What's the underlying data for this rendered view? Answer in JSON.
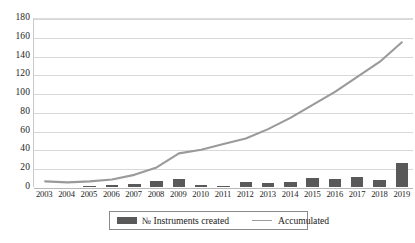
{
  "chart_data": {
    "type": "bar",
    "title": "",
    "subtitle": "",
    "xlabel": "",
    "ylabel": "",
    "ylim": [
      0,
      180
    ],
    "ytick_step": 20,
    "yticks": [
      180,
      160,
      140,
      120,
      100,
      80,
      60,
      40,
      20,
      0
    ],
    "grid": true,
    "legend_position": "bottom-center",
    "categories": [
      "2003",
      "2004",
      "2005",
      "2006",
      "2007",
      "2008",
      "2009",
      "2010",
      "2011",
      "2012",
      "2013",
      "2014",
      "2015",
      "2016",
      "2017",
      "2018",
      "2019"
    ],
    "series": [
      {
        "name": "№ Instruments created",
        "type": "bar",
        "color": "#595959",
        "values": [
          0,
          0,
          1,
          2,
          3,
          6,
          9,
          2,
          1,
          5,
          4,
          5,
          10,
          9,
          11,
          7,
          26
        ]
      },
      {
        "name": "Accumulated",
        "type": "line",
        "color": "#9a9a9a",
        "values": [
          6,
          5,
          6,
          8,
          13,
          21,
          36,
          40,
          46,
          52,
          62,
          74,
          88,
          102,
          118,
          134,
          155
        ]
      }
    ]
  },
  "legend": {
    "bar_label": "№ Instruments created",
    "line_label": "Accumulated"
  },
  "colors": {
    "bar": "#595959",
    "line": "#9a9a9a",
    "grid": "#d8d8d8",
    "axis": "#b8b8b8",
    "text": "#1a1a1a",
    "background": "#ffffff"
  }
}
